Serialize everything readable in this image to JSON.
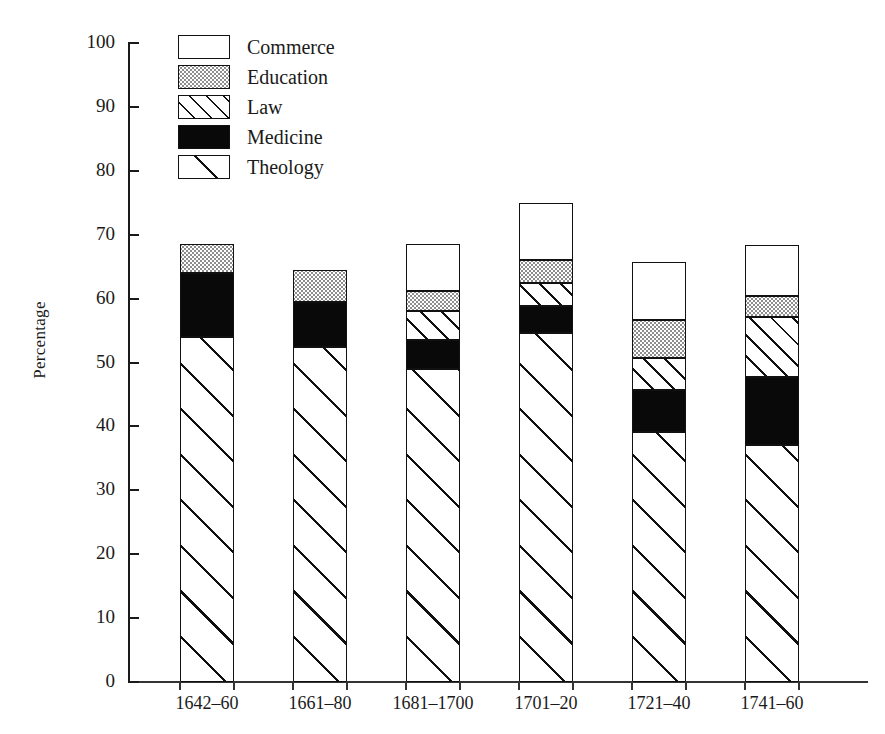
{
  "chart_data": {
    "type": "bar",
    "subtype": "stacked",
    "title": "",
    "xlabel": "",
    "ylabel": "Percentage",
    "ylim": [
      0,
      100
    ],
    "yticks": [
      0,
      10,
      20,
      30,
      40,
      50,
      60,
      70,
      80,
      90,
      100
    ],
    "ytick_labels": [
      "0",
      "10",
      "20",
      "30",
      "40",
      "50",
      "60",
      "70",
      "80",
      "90",
      "100"
    ],
    "grid": false,
    "legend_position": "upper-left-inside",
    "categories": [
      "1642–60",
      "1661–80",
      "1681–1700",
      "1701–20",
      "1721–40",
      "1741–60"
    ],
    "stack_order_bottom_to_top": [
      "Theology",
      "Medicine",
      "Law",
      "Education",
      "Commerce"
    ],
    "series": [
      {
        "name": "Theology",
        "pattern": "diagonal-hatch-wide",
        "values": [
          54.0,
          52.5,
          49.0,
          54.6,
          39.1,
          37.1
        ]
      },
      {
        "name": "Medicine",
        "pattern": "solid-black",
        "values": [
          10.0,
          7.0,
          4.5,
          4.2,
          6.6,
          10.6
        ]
      },
      {
        "name": "Law",
        "pattern": "diagonal-hatch-narrow",
        "values": [
          0.0,
          0.0,
          4.5,
          3.7,
          5.0,
          9.4
        ]
      },
      {
        "name": "Education",
        "pattern": "dotted-gray",
        "values": [
          4.5,
          5.0,
          3.2,
          3.5,
          6.0,
          3.3
        ]
      },
      {
        "name": "Commerce",
        "pattern": "white",
        "values": [
          0.0,
          0.0,
          7.3,
          9.0,
          9.0,
          8.0
        ]
      }
    ],
    "totals": [
      68.5,
      64.5,
      68.5,
      75.0,
      65.7,
      68.4
    ],
    "legend": [
      {
        "label": "Commerce",
        "pattern": "white"
      },
      {
        "label": "Education",
        "pattern": "dotted-gray"
      },
      {
        "label": "Law",
        "pattern": "diagonal-hatch-narrow"
      },
      {
        "label": "Medicine",
        "pattern": "solid-black"
      },
      {
        "label": "Theology",
        "pattern": "diagonal-hatch-wide"
      }
    ],
    "colors": {
      "axis": "#1a1a1a",
      "outline": "#111111",
      "commerce": "#ffffff",
      "education": "#d9d9d9",
      "law": "#ffffff",
      "medicine": "#090909",
      "theology": "#ffffff",
      "background": "#ffffff"
    }
  }
}
